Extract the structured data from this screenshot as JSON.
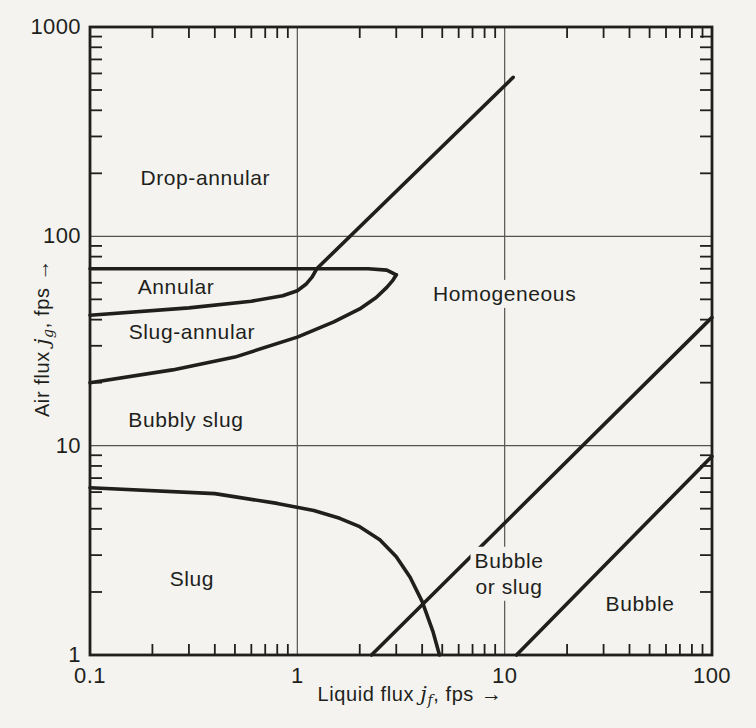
{
  "figure": {
    "background": "#f5f3ef",
    "ink": "#211f1c",
    "grid_color": "#56534e"
  },
  "axes": {
    "x": {
      "label_prefix": "Liquid flux ",
      "label_var": "j",
      "label_sub": "f",
      "label_suffix": ", fps",
      "arrow": "→",
      "ticks": [
        "0.1",
        "1",
        "10",
        "100"
      ]
    },
    "y": {
      "label_prefix": "Air flux ",
      "label_var": "j",
      "label_sub": "g",
      "label_suffix": ", fps",
      "arrow": "→",
      "ticks": [
        "1",
        "10",
        "100",
        "1000"
      ]
    }
  },
  "chart_data": {
    "type": "line",
    "title": "",
    "xlabel": "Liquid flux jf, fps",
    "ylabel": "Air flux jg, fps",
    "xscale": "log",
    "yscale": "log",
    "xlim": [
      0.1,
      100
    ],
    "ylim": [
      1,
      1000
    ],
    "x_ticks": [
      0.1,
      1,
      10,
      100
    ],
    "y_ticks": [
      1,
      10,
      100,
      1000
    ],
    "grid_x": [
      1,
      10
    ],
    "grid_y": [
      10,
      100
    ],
    "grid_on": true,
    "legend": null,
    "series": [
      {
        "name": "annular-top",
        "points": [
          [
            0.1,
            70
          ],
          [
            1.5,
            70
          ],
          [
            2.2,
            70
          ],
          [
            2.7,
            69
          ],
          [
            3.0,
            65.5
          ]
        ]
      },
      {
        "name": "annular-homogeneous",
        "points": [
          [
            0.1,
            42
          ],
          [
            0.3,
            45.5
          ],
          [
            0.6,
            49
          ],
          [
            0.85,
            52
          ],
          [
            1.0,
            55
          ],
          [
            1.1,
            59
          ],
          [
            1.18,
            64
          ],
          [
            1.24,
            70
          ],
          [
            11,
            575
          ]
        ]
      },
      {
        "name": "slug-annular-bottom",
        "points": [
          [
            0.1,
            20
          ],
          [
            0.25,
            23
          ],
          [
            0.5,
            26.5
          ],
          [
            1.0,
            33
          ],
          [
            1.5,
            39
          ],
          [
            2.0,
            45
          ],
          [
            2.4,
            51
          ],
          [
            2.7,
            57
          ],
          [
            2.9,
            62
          ],
          [
            3.0,
            65.5
          ]
        ]
      },
      {
        "name": "slug-top",
        "points": [
          [
            0.1,
            6.3
          ],
          [
            0.4,
            5.9
          ],
          [
            0.8,
            5.3
          ],
          [
            1.2,
            4.9
          ],
          [
            1.6,
            4.5
          ],
          [
            2.0,
            4.1
          ],
          [
            2.5,
            3.55
          ],
          [
            3.0,
            2.95
          ],
          [
            3.5,
            2.35
          ],
          [
            4.0,
            1.8
          ],
          [
            4.5,
            1.3
          ],
          [
            4.85,
            1.0
          ]
        ]
      },
      {
        "name": "bubble-or-slug-left",
        "points": [
          [
            2.28,
            1
          ],
          [
            100,
            41
          ]
        ]
      },
      {
        "name": "bubble-left",
        "points": [
          [
            11.4,
            1
          ],
          [
            100,
            8.9
          ]
        ]
      }
    ],
    "regions": [
      {
        "lines": [
          "Drop-annular"
        ],
        "x": 0.36,
        "y": 190
      },
      {
        "lines": [
          "Annular"
        ],
        "x": 0.26,
        "y": 57
      },
      {
        "lines": [
          "Slug-annular"
        ],
        "x": 0.31,
        "y": 35
      },
      {
        "lines": [
          "Bubbly slug"
        ],
        "x": 0.29,
        "y": 13.3
      },
      {
        "lines": [
          "Slug"
        ],
        "x": 0.31,
        "y": 2.3
      },
      {
        "lines": [
          "Homogeneous"
        ],
        "x": 10.0,
        "y": 53
      },
      {
        "lines": [
          "Bubble",
          "or slug"
        ],
        "x": 10.5,
        "y": 2.45
      },
      {
        "lines": [
          "Bubble"
        ],
        "x": 45,
        "y": 1.75
      }
    ]
  }
}
